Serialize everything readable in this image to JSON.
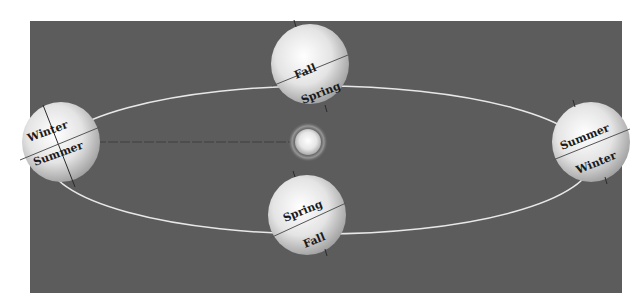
{
  "diagram": {
    "colors": {
      "page_bg": "#ffffff",
      "panel_bg": "#5c5c5c",
      "orbit": "#e8e8e8",
      "earth_light": "#ffffff",
      "earth_dark": "#9a9a9a",
      "axis": "#2a2a2a",
      "sun_light": "#ffffff",
      "sun_dark": "#c8c8c8",
      "dashed_line": "#3a3a3a"
    },
    "sun": {
      "label": "Sun"
    },
    "earths": [
      {
        "id": "left",
        "position": "left",
        "north_label": "Winter",
        "south_label": "Summer"
      },
      {
        "id": "top",
        "position": "top",
        "north_label": "Fall",
        "south_label": "Spring"
      },
      {
        "id": "right",
        "position": "right",
        "north_label": "Summer",
        "south_label": "Winter"
      },
      {
        "id": "bottom",
        "position": "bottom",
        "north_label": "Spring",
        "south_label": "Fall"
      }
    ]
  }
}
